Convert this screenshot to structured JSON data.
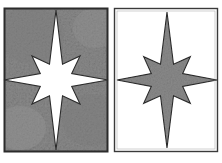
{
  "figure": {
    "name": "eight-pointed-star-pair",
    "canvas": {
      "width": 222,
      "height": 163,
      "background_color": "#ffffff"
    },
    "palette": {
      "ink": "#2b2b2b",
      "border": "#3a3a3a",
      "gray_fill": "#8a8a8a",
      "gray_light": "#9a9a9a",
      "gray_dark": "#757575",
      "white": "#ffffff",
      "page": "#ffffff"
    },
    "panels": [
      {
        "id": "left-panel",
        "label": "Left panel",
        "position": {
          "x": 4,
          "y": 8,
          "width": 104,
          "height": 144
        },
        "background_fill": "#8a8a8a",
        "background_texture": "mottled-gray",
        "border_color": "#2b2b2b",
        "border_width": 2,
        "star": {
          "label": "White eight-pointed star on gray ground",
          "fill": "#ffffff",
          "stroke": "#2b2b2b",
          "stroke_width": 1,
          "center": {
            "x": 56,
            "y": 80
          },
          "points": 8,
          "outer_radius_vertical": 70,
          "outer_radius_horizontal": 52,
          "outer_radius_diagonal": 34,
          "inner_radius": 17,
          "rotation_deg": 0
        }
      },
      {
        "id": "right-panel",
        "label": "Right panel",
        "position": {
          "x": 114,
          "y": 8,
          "width": 104,
          "height": 144
        },
        "background_fill": "#ffffff",
        "background_texture": "none",
        "border_color": "#3a3a3a",
        "border_width": 1,
        "star": {
          "label": "Gray eight-pointed star on white ground",
          "fill": "#8a8a8a",
          "stroke": "#2b2b2b",
          "stroke_width": 1,
          "center": {
            "x": 167,
            "y": 80
          },
          "points": 8,
          "outer_radius_vertical": 68,
          "outer_radius_horizontal": 50,
          "outer_radius_diagonal": 33,
          "inner_radius": 17,
          "rotation_deg": 0
        }
      }
    ]
  }
}
